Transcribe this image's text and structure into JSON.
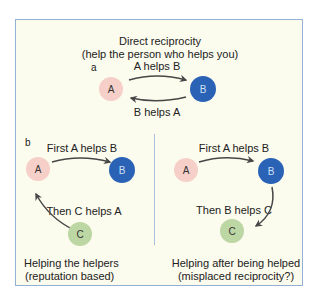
{
  "colors": {
    "frame_border": "#93b1d6",
    "background": "#fbfbee",
    "node_a": "#f5cfc8",
    "node_b": "#2a62b5",
    "node_c": "#bcd6a4",
    "arrow": "#474747"
  },
  "panel_a": {
    "title": "Direct reciprocity",
    "subtitle": "(help the person who helps you)",
    "label": "a",
    "arrow_top": "A helps B",
    "arrow_bottom": "B helps A",
    "nodes": [
      "A",
      "B"
    ]
  },
  "panel_b_left": {
    "label": "b",
    "arrow_top": "First A helps B",
    "arrow_side": "Then C helps A",
    "caption_line1": "Helping the helpers",
    "caption_line2": "(reputation based)",
    "nodes": [
      "A",
      "B",
      "C"
    ]
  },
  "panel_b_right": {
    "arrow_top": "First A helps B",
    "arrow_side": "Then B helps C",
    "caption_line1": "Helping after being helped",
    "caption_line2": "(misplaced reciprocity?)",
    "nodes": [
      "A",
      "B",
      "C"
    ]
  }
}
